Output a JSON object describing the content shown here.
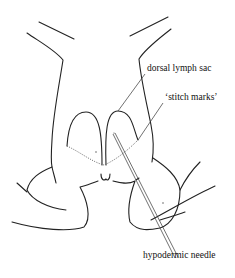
{
  "figure": {
    "type": "anatomical-diagram",
    "labels": [
      {
        "id": "dorsal_lymph_sac",
        "text": "dorsal lymph sac"
      },
      {
        "id": "stitch_marks",
        "text": "‘stitch marks’"
      },
      {
        "id": "hypodermic_needle",
        "text": "hypodermic needle"
      }
    ]
  }
}
